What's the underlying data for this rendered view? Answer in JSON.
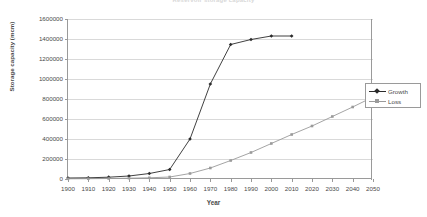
{
  "chart_data": {
    "type": "line",
    "title": "Reservoir storage capacity",
    "xlabel": "Year",
    "ylabel": "Storage capacity (mcm)",
    "xlim": [
      1900,
      2050
    ],
    "ylim": [
      0,
      1600000
    ],
    "ytick_step": 200000,
    "xtick_step": 10,
    "grid": true,
    "legend_position": "right",
    "categories": [
      1900,
      1910,
      1920,
      1930,
      1940,
      1950,
      1960,
      1970,
      1980,
      1990,
      2000,
      2010,
      2020,
      2030,
      2040,
      2050
    ],
    "x_tick_labels": [
      "1900",
      "1910",
      "1920",
      "1930",
      "1940",
      "1950",
      "1960",
      "1970",
      "1980",
      "1990",
      "2000",
      "2010",
      "2020",
      "2030",
      "2040",
      "2050"
    ],
    "y_tick_labels": [
      "0",
      "200000",
      "400000",
      "600000",
      "800000",
      "1000000",
      "1200000",
      "1400000",
      "1600000"
    ],
    "y_tick_values": [
      0,
      200000,
      400000,
      600000,
      800000,
      1000000,
      1200000,
      1400000,
      1600000
    ],
    "series": [
      {
        "name": "Growth",
        "color": "#2b2b2b",
        "marker": "diamond",
        "x": [
          1900,
          1910,
          1920,
          1930,
          1940,
          1950,
          1960,
          1970,
          1980,
          1990,
          2000,
          2010
        ],
        "values": [
          10000,
          12000,
          18000,
          30000,
          55000,
          95000,
          400000,
          950000,
          1345000,
          1395000,
          1430000,
          1430000
        ]
      },
      {
        "name": "Loss",
        "color": "#9a9a9a",
        "marker": "square",
        "x": [
          1900,
          1910,
          1920,
          1930,
          1940,
          1950,
          1960,
          1970,
          1980,
          1990,
          2000,
          2010,
          2020,
          2030,
          2040,
          2050
        ],
        "values": [
          2000,
          3000,
          5000,
          8000,
          12000,
          20000,
          55000,
          110000,
          185000,
          265000,
          355000,
          445000,
          530000,
          625000,
          720000,
          820000
        ]
      }
    ]
  },
  "legend": {
    "entries": [
      {
        "label": "Growth"
      },
      {
        "label": "Loss"
      }
    ]
  },
  "axis": {
    "x_title": "Year",
    "y_title": "Storage capacity (mcm)"
  }
}
